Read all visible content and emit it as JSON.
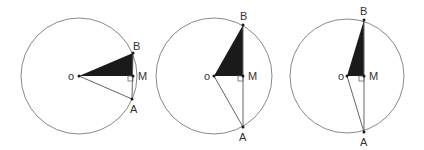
{
  "diagram": {
    "colors": {
      "circle": "#888888",
      "line": "#666666",
      "fill": "#1a1a1a",
      "label": "#333333"
    },
    "figures": [
      {
        "center": {
          "x": 79,
          "y": 76
        },
        "r": 58,
        "O": {
          "x": 79,
          "y": 76,
          "label": "o"
        },
        "B": {
          "x": 133,
          "y": 53,
          "label": "B"
        },
        "M": {
          "x": 133,
          "y": 76,
          "label": "M"
        },
        "A": {
          "x": 132,
          "y": 99,
          "label": "A"
        }
      },
      {
        "center": {
          "x": 214,
          "y": 76
        },
        "r": 58,
        "O": {
          "x": 214,
          "y": 76,
          "label": "o"
        },
        "B": {
          "x": 243,
          "y": 25,
          "label": "B"
        },
        "M": {
          "x": 243,
          "y": 76,
          "label": "M"
        },
        "A": {
          "x": 243,
          "y": 127,
          "label": "A"
        }
      },
      {
        "center": {
          "x": 347,
          "y": 76
        },
        "r": 57,
        "O": {
          "x": 347,
          "y": 76,
          "label": "o"
        },
        "B": {
          "x": 364,
          "y": 20,
          "label": "B"
        },
        "M": {
          "x": 364,
          "y": 76,
          "label": "M"
        },
        "A": {
          "x": 364,
          "y": 132,
          "label": "A"
        }
      }
    ]
  }
}
